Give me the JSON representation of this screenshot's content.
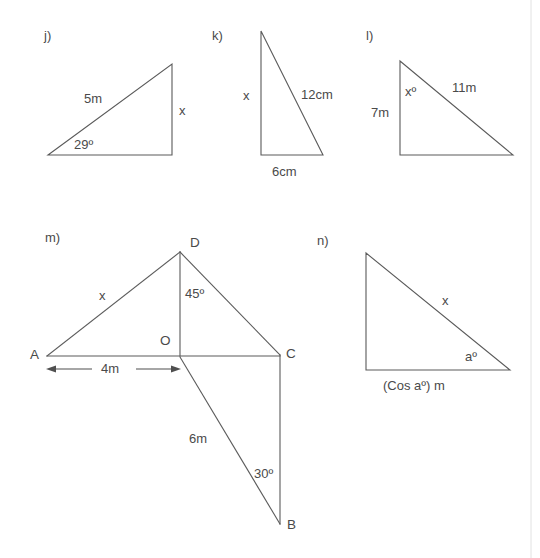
{
  "page": {
    "background_color": "#ffffff",
    "stroke_color": "#5a5a5a",
    "text_color": "#4a4a4a",
    "width": 540,
    "height": 558
  },
  "figures": {
    "j": {
      "part_label": "j)",
      "hypotenuse_label": "5m",
      "vertical_label": "x",
      "angle_label": "29º"
    },
    "k": {
      "part_label": "k)",
      "vertical_label": "x",
      "hypotenuse_label": "12cm",
      "base_label": "6cm"
    },
    "l": {
      "part_label": "l)",
      "vertical_label": "7m",
      "angle_label": "xº",
      "hypotenuse_label": "11m"
    },
    "m": {
      "part_label": "m)",
      "vertex_a": "A",
      "vertex_b": "B",
      "vertex_c": "C",
      "vertex_d": "D",
      "vertex_o": "O",
      "side_ad_label": "x",
      "angle_at_d_label": "45º",
      "angle_at_b_label": "30º",
      "side_ob_label": "6m",
      "dimension_ao_label": "4m"
    },
    "n": {
      "part_label": "n)",
      "hypotenuse_label": "x",
      "angle_label": "aº",
      "base_label": "(Cos aº) m"
    }
  }
}
